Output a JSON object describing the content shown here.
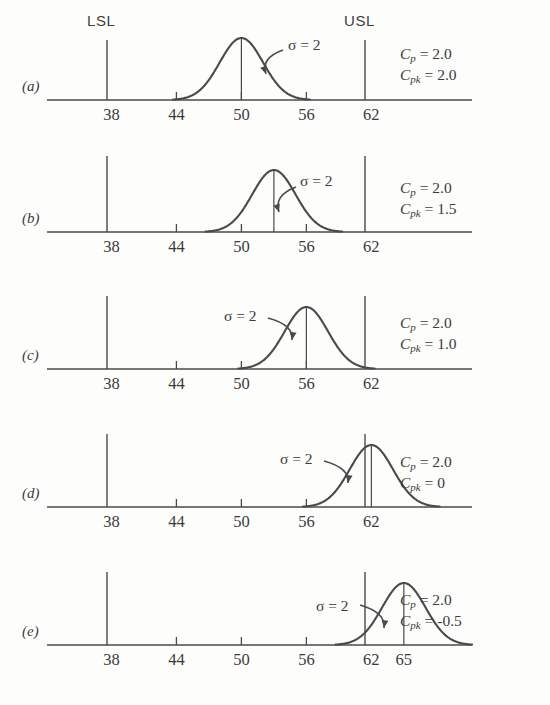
{
  "figure": {
    "width": 550,
    "height": 705,
    "background": "#fdfdfc",
    "stroke_color": "#4a4a4a",
    "text_color": "#3b3b3b"
  },
  "axis": {
    "tick_values": [
      38,
      44,
      50,
      56,
      62
    ],
    "tick_labels": [
      "38",
      "44",
      "50",
      "56",
      "62"
    ],
    "extra_tick_label": "65",
    "x_min_value": 33.5,
    "x_max_value": 70.5,
    "pixel_left": 47,
    "pixel_right": 472,
    "value_at_pixel_left": 32.05,
    "pixels_per_unit": 10.83
  },
  "limits": {
    "lsl_label": "LSL",
    "usl_label": "USL",
    "lsl_value": 38,
    "usl_value": 62,
    "lsl_x_px": 107,
    "usl_x_px": 365
  },
  "sigma_label": "σ = 2",
  "cap_symbols": {
    "cp_var": "C",
    "cp_sub": "p",
    "cpk_var": "C",
    "cpk_sub": "pk",
    "equals": " = "
  },
  "chart_data": {
    "type": "line",
    "title": "",
    "xlabel": "",
    "ylabel": "",
    "xlim": [
      33.5,
      70.5
    ],
    "grid": false,
    "legend": "none",
    "shared_limits": {
      "LSL": 38,
      "USL": 62
    },
    "shared_sigma": 2,
    "panels": [
      {
        "id": "a",
        "label": "(a)",
        "mean": 50,
        "sigma": 2,
        "curve_span": [
          44,
          56
        ],
        "cp": "2.0",
        "cpk": "2.0",
        "cp_text": "2.0",
        "cpk_text": "2.0",
        "sigma_side": "right",
        "show_limit_headers": true,
        "ticks_on_axis": [
          44,
          50,
          56
        ],
        "center_line_value": 50
      },
      {
        "id": "b",
        "label": "(b)",
        "mean": 53,
        "sigma": 2,
        "curve_span": [
          47,
          59
        ],
        "cp": "2.0",
        "cpk": "1.5",
        "cp_text": "2.0",
        "cpk_text": "1.5",
        "sigma_side": "right",
        "show_limit_headers": false,
        "ticks_on_axis": [
          44,
          50,
          56
        ],
        "center_line_value": 53
      },
      {
        "id": "c",
        "label": "(c)",
        "mean": 56,
        "sigma": 2,
        "curve_span": [
          50,
          62
        ],
        "cp": "2.0",
        "cpk": "1.0",
        "cp_text": "2.0",
        "cpk_text": "1.0",
        "sigma_side": "left",
        "show_limit_headers": false,
        "ticks_on_axis": [
          44,
          50,
          56
        ],
        "center_line_value": 56
      },
      {
        "id": "d",
        "label": "(d)",
        "mean": 62,
        "sigma": 2,
        "curve_span": [
          56,
          68
        ],
        "cp": "2.0",
        "cpk": "0",
        "cp_text": "2.0",
        "cpk_text": "0",
        "sigma_side": "left",
        "show_limit_headers": false,
        "ticks_on_axis": [
          44,
          50,
          56
        ],
        "center_line_value": 62
      },
      {
        "id": "e",
        "label": "(e)",
        "mean": 65,
        "sigma": 2,
        "curve_span": [
          59,
          71
        ],
        "cp": "2.0",
        "cpk": "-0.5",
        "cp_text": "2.0",
        "cpk_text": "-0.5",
        "sigma_side": "left",
        "show_limit_headers": false,
        "ticks_on_axis": [
          44,
          50,
          56
        ],
        "center_line_value": 65,
        "extra_center_tick": 65
      }
    ]
  }
}
